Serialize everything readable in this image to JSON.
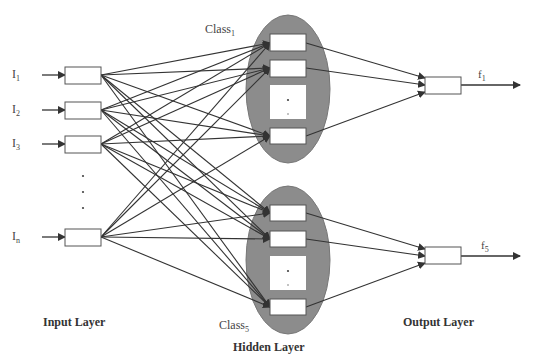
{
  "diagram": {
    "type": "neural-network",
    "colors": {
      "ellipse_fill": "#8c8c8c",
      "line": "#333333",
      "box_fill": "#ffffff",
      "box_stroke": "#555555"
    }
  },
  "inputs": [
    {
      "base": "I",
      "sub": "1"
    },
    {
      "base": "I",
      "sub": "2"
    },
    {
      "base": "I",
      "sub": "3"
    },
    {
      "base": "I",
      "sub": "n"
    }
  ],
  "classes": [
    {
      "base": "Class",
      "sub": "1"
    },
    {
      "base": "Class",
      "sub": "5"
    }
  ],
  "outputs": [
    {
      "base": "f",
      "sub": "1"
    },
    {
      "base": "f",
      "sub": "5"
    }
  ],
  "layers": {
    "input": "Input Layer",
    "hidden": "Hidden Layer",
    "output": "Output Layer"
  },
  "ellipsis": "· · ·"
}
